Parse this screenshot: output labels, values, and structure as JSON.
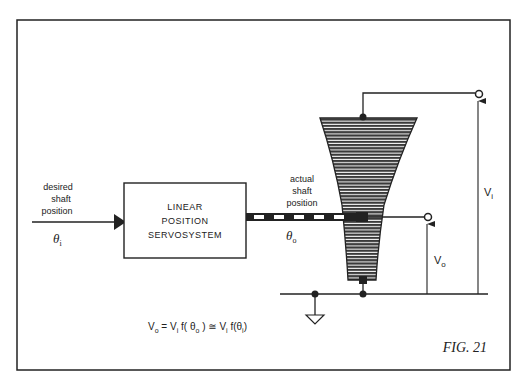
{
  "figure": {
    "label": "FIG. 21",
    "colors": {
      "ink": "#222222",
      "paper": "#ffffff",
      "pot_fill": "#3a3a3a"
    }
  },
  "input": {
    "label_lines": [
      "desired",
      "shaft",
      "position"
    ],
    "symbol": "θ",
    "subscript": "i"
  },
  "block": {
    "lines": [
      "LINEAR",
      "POSITION",
      "SERVOSYSTEM"
    ]
  },
  "output_shaft": {
    "label_lines": [
      "actual",
      "shaft",
      "position"
    ],
    "symbol": "θ",
    "subscript": "o"
  },
  "terminals": {
    "vi": {
      "symbol": "V",
      "subscript": "i"
    },
    "vo": {
      "symbol": "V",
      "subscript": "o"
    }
  },
  "equation": {
    "lhs": "V",
    "lhs_sub": "o",
    "eq": " = V",
    "v_sub1": "i",
    "f1": " f( θ",
    "theta_sub1": "o",
    "f1_close": " )",
    "approx": " ≅ V",
    "v_sub2": "i",
    "f2": " f(θ",
    "theta_sub2": "i",
    "f2_close": ")"
  },
  "components": {
    "potentiometer": "tapered-wiper-resistor-icon",
    "ground": "ground-icon"
  }
}
